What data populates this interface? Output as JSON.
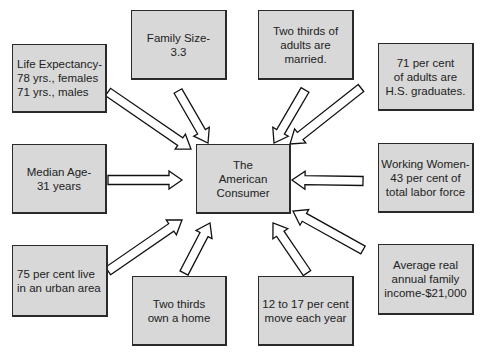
{
  "diagram": {
    "center": {
      "label": "The\nAmerican\nConsumer"
    },
    "boxes": [
      {
        "id": "life-expectancy",
        "label": "Life Expectancy-\n78 yrs., females\n71 yrs., males"
      },
      {
        "id": "family-size",
        "label": "Family Size-\n3.3"
      },
      {
        "id": "married",
        "label": "Two thirds of\nadults are married."
      },
      {
        "id": "hs-graduates",
        "label": "71 per cent\nof adults are\nH.S. graduates."
      },
      {
        "id": "median-age",
        "label": "Median Age-\n31 years"
      },
      {
        "id": "working-women",
        "label": "Working Women-\n43 per cent of\ntotal labor force"
      },
      {
        "id": "urban",
        "label": "75 per cent live\nin an urban area"
      },
      {
        "id": "own-home",
        "label": "Two thirds\nown a home"
      },
      {
        "id": "move",
        "label": "12 to 17 per cent\nmove each year"
      },
      {
        "id": "income",
        "label": "Average real\nannual family\nincome-$21,000"
      }
    ],
    "colors": {
      "box_fill": "#d8d8d8",
      "border": "#2a2a2a",
      "arrow_fill": "#ffffff"
    }
  }
}
